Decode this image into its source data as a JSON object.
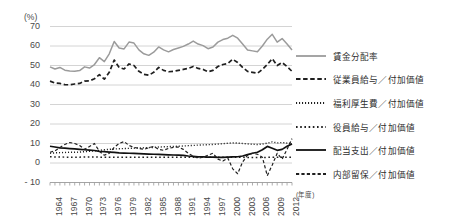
{
  "axis": {
    "y_unit_label": "(%)",
    "x_unit_label": "(年度)",
    "y_ticks": [
      "70",
      "60",
      "50",
      "40",
      "30",
      "20",
      "10",
      "0",
      "- 10"
    ],
    "x_ticks": [
      "1964",
      "1967",
      "1970",
      "1973",
      "1976",
      "1979",
      "1982",
      "1985",
      "1988",
      "1991",
      "1994",
      "1997",
      "2000",
      "2003",
      "2006",
      "2009",
      "2012"
    ]
  },
  "legend": {
    "items": [
      {
        "label": "賃金分配率",
        "style": "solid-gray",
        "color": "#9b9b9b"
      },
      {
        "label": "従業員給与／付加価値",
        "style": "dash-bold",
        "color": "#1f1f1f"
      },
      {
        "label": "福利厚生費／付加価値",
        "style": "dot-fine",
        "color": "#1f1f1f"
      },
      {
        "label": "役員給与／付加価値",
        "style": "dot-medium",
        "color": "#1f1f1f"
      },
      {
        "label": "配当支出／付加価値",
        "style": "solid-black",
        "color": "#111111"
      },
      {
        "label": "内部留保／付加価値",
        "style": "dash-thin",
        "color": "#1f1f1f"
      }
    ]
  },
  "chart_data": {
    "type": "line",
    "title": "",
    "xlabel": "(年度)",
    "ylabel": "(%)",
    "ylim": [
      -10,
      70
    ],
    "xlim": [
      1964,
      2013
    ],
    "grid": true,
    "legend_position": "right",
    "x": [
      1964,
      1965,
      1966,
      1967,
      1968,
      1969,
      1970,
      1971,
      1972,
      1973,
      1974,
      1975,
      1976,
      1977,
      1978,
      1979,
      1980,
      1981,
      1982,
      1983,
      1984,
      1985,
      1986,
      1987,
      1988,
      1989,
      1990,
      1991,
      1992,
      1993,
      1994,
      1995,
      1996,
      1997,
      1998,
      1999,
      2000,
      2001,
      2002,
      2003,
      2004,
      2005,
      2006,
      2007,
      2008,
      2009,
      2010,
      2011,
      2012,
      2013
    ],
    "series": [
      {
        "name": "賃金分配率",
        "style": "solid-gray",
        "color": "#9b9b9b",
        "values": [
          49.3,
          48.2,
          49.0,
          47.6,
          47.2,
          47.1,
          47.4,
          49.3,
          48.7,
          50.5,
          54.0,
          52.0,
          56.0,
          62.3,
          59.0,
          58.5,
          62.0,
          61.5,
          58.0,
          56.0,
          55.2,
          56.8,
          59.5,
          58.0,
          57.0,
          58.2,
          59.0,
          59.8,
          61.0,
          62.5,
          61.0,
          60.2,
          58.6,
          59.5,
          62.0,
          63.3,
          64.0,
          65.5,
          64.0,
          61.0,
          58.0,
          57.5,
          57.0,
          60.0,
          63.5,
          66.0,
          62.0,
          63.8,
          61.0,
          58.0
        ]
      },
      {
        "name": "従業員給与／付加価値",
        "style": "dash-bold",
        "color": "#1f1f1f",
        "values": [
          42.0,
          41.0,
          40.8,
          40.2,
          40.1,
          40.5,
          40.8,
          42.0,
          42.1,
          43.2,
          45.3,
          43.0,
          46.5,
          52.8,
          49.0,
          48.2,
          50.8,
          50.0,
          47.0,
          45.5,
          45.0,
          46.5,
          49.0,
          47.5,
          46.8,
          47.0,
          47.5,
          48.0,
          48.5,
          49.5,
          48.5,
          48.0,
          46.8,
          47.5,
          49.5,
          50.5,
          51.0,
          53.2,
          51.5,
          49.0,
          47.0,
          46.5,
          46.0,
          48.0,
          50.5,
          53.5,
          50.0,
          51.5,
          49.5,
          47.0
        ]
      },
      {
        "name": "福利厚生費／付加価値",
        "style": "dot-fine",
        "color": "#1f1f1f",
        "values": [
          5.0,
          5.2,
          5.3,
          5.4,
          5.5,
          5.5,
          5.6,
          5.8,
          6.0,
          6.2,
          6.5,
          6.8,
          7.0,
          7.2,
          7.3,
          7.4,
          7.5,
          7.6,
          7.7,
          7.8,
          7.9,
          8.0,
          8.2,
          8.3,
          8.4,
          8.5,
          8.6,
          8.7,
          8.9,
          9.0,
          9.2,
          9.3,
          9.4,
          9.5,
          9.7,
          9.9,
          10.1,
          10.3,
          10.2,
          10.0,
          9.8,
          9.6,
          9.5,
          9.7,
          10.2,
          10.8,
          10.3,
          10.5,
          10.2,
          10.0
        ]
      },
      {
        "name": "役員給与／付加価値",
        "style": "dot-medium",
        "color": "#1f1f1f",
        "values": [
          3.2,
          3.1,
          3.1,
          3.0,
          3.0,
          3.0,
          3.0,
          3.1,
          3.1,
          3.1,
          3.0,
          3.0,
          3.0,
          3.0,
          2.9,
          2.9,
          2.9,
          2.9,
          2.9,
          2.9,
          2.9,
          2.9,
          2.9,
          2.9,
          2.9,
          2.9,
          2.9,
          2.9,
          3.0,
          3.0,
          3.0,
          3.0,
          3.0,
          3.0,
          3.0,
          3.0,
          3.0,
          3.0,
          3.0,
          2.9,
          2.8,
          2.8,
          2.8,
          2.8,
          2.9,
          3.0,
          2.9,
          2.9,
          2.9,
          2.9
        ]
      },
      {
        "name": "配当支出／付加価値",
        "style": "solid-black",
        "color": "#111111",
        "values": [
          8.6,
          8.2,
          7.8,
          7.6,
          7.4,
          7.2,
          7.0,
          6.8,
          6.6,
          6.4,
          6.0,
          5.8,
          5.6,
          5.4,
          5.2,
          5.1,
          5.0,
          4.9,
          4.8,
          4.7,
          4.6,
          4.5,
          4.4,
          4.3,
          4.2,
          4.1,
          4.0,
          3.9,
          3.6,
          3.4,
          3.2,
          3.1,
          3.0,
          3.0,
          2.9,
          2.9,
          3.0,
          3.1,
          3.2,
          3.6,
          4.3,
          5.0,
          5.5,
          6.8,
          8.5,
          7.6,
          6.5,
          7.0,
          8.6,
          9.8
        ]
      },
      {
        "name": "内部留保／付加価値",
        "style": "dash-thin",
        "color": "#1f1f1f",
        "values": [
          5.5,
          6.2,
          8.0,
          9.5,
          10.5,
          10.0,
          9.0,
          7.0,
          8.5,
          10.0,
          6.0,
          4.0,
          5.0,
          8.0,
          10.0,
          11.0,
          9.0,
          8.0,
          7.5,
          7.0,
          7.8,
          8.5,
          7.0,
          6.5,
          7.5,
          8.0,
          8.2,
          7.0,
          5.0,
          3.5,
          2.5,
          3.0,
          4.0,
          5.0,
          2.0,
          1.0,
          2.5,
          -3.0,
          -5.5,
          0.5,
          4.0,
          5.0,
          4.5,
          3.0,
          -6.5,
          -1.0,
          5.0,
          2.0,
          7.0,
          12.5
        ]
      }
    ]
  }
}
